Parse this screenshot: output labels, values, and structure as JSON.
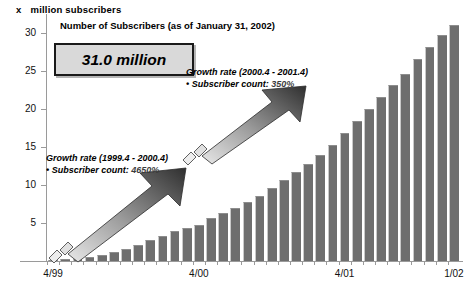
{
  "axis_caption": {
    "symbol": "x",
    "text": "million subscribers"
  },
  "title": "Number of Subscribers (as of January 31, 2002)",
  "value_box": {
    "label": "31.0 million"
  },
  "annotations": [
    {
      "id": "upper",
      "heading": "Growth rate (2000.4 - 2001.4)",
      "bullet_label": "• Subscriber count:",
      "bullet_value": "350%"
    },
    {
      "id": "lower",
      "heading": "Growth rate (1999.4 - 2000.4)",
      "bullet_label": "• Subscriber count:",
      "bullet_value": "4650%"
    }
  ],
  "colors": {
    "bar": "#6e6e6e",
    "axis": "#9a9a9a",
    "box_fill": "#d9d9d9",
    "box_border": "#1a1a1a",
    "arrow_dark": "#3f3f3f",
    "arrow_light": "#e2e2e2"
  },
  "chart_data": {
    "type": "bar",
    "title": "Number of Subscribers (as of January 31, 2002)",
    "xlabel": "",
    "ylabel": "x million subscribers",
    "ylim": [
      0,
      32.5
    ],
    "yticks": [
      5,
      10,
      15,
      20,
      25,
      30
    ],
    "grid": false,
    "legend": null,
    "xtick_labels": [
      "4/99",
      "4/00",
      "4/01",
      "1/02"
    ],
    "xtick_indices": [
      0,
      12,
      24,
      33
    ],
    "categories": [
      "4/99",
      "5/99",
      "6/99",
      "7/99",
      "8/99",
      "9/99",
      "10/99",
      "11/99",
      "12/99",
      "1/00",
      "2/00",
      "3/00",
      "4/00",
      "5/00",
      "6/00",
      "7/00",
      "8/00",
      "9/00",
      "10/00",
      "11/00",
      "12/00",
      "1/01",
      "2/01",
      "3/01",
      "4/01",
      "5/01",
      "6/01",
      "7/01",
      "8/01",
      "9/01",
      "10/01",
      "11/01",
      "12/01",
      "1/02"
    ],
    "values": [
      0.1,
      0.2,
      0.3,
      0.5,
      0.8,
      1.2,
      1.6,
      2.1,
      2.7,
      3.3,
      3.9,
      4.4,
      4.8,
      5.6,
      6.3,
      7.0,
      7.8,
      8.6,
      9.6,
      10.6,
      11.7,
      12.8,
      14.0,
      15.2,
      16.8,
      18.4,
      20.0,
      21.6,
      23.2,
      24.6,
      26.6,
      28.2,
      29.8,
      31.0
    ]
  }
}
